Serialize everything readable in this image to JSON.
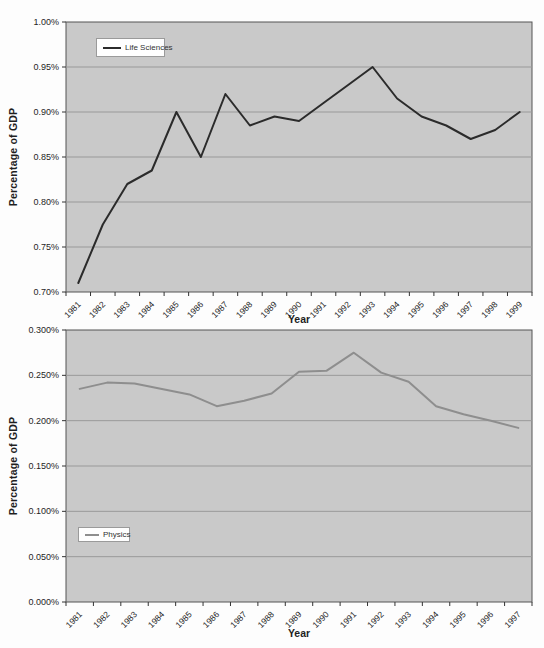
{
  "page": {
    "background": "#fdfdfd"
  },
  "chart_data": [
    {
      "type": "line",
      "title": "",
      "xlabel": "Year",
      "ylabel": "Percentage of GDP",
      "legend_position": "inside-top-left",
      "grid": true,
      "categories": [
        "1981",
        "1982",
        "1983",
        "1984",
        "1985",
        "1986",
        "1987",
        "1988",
        "1989",
        "1990",
        "1991",
        "1992",
        "1993",
        "1994",
        "1995",
        "1996",
        "1997",
        "1998",
        "1999"
      ],
      "series": [
        {
          "name": "Life Sciences",
          "color": "#2b2b2b",
          "values": [
            0.71,
            0.775,
            0.82,
            0.835,
            0.9,
            0.85,
            0.92,
            0.885,
            0.895,
            0.89,
            0.91,
            0.93,
            0.95,
            0.915,
            0.895,
            0.885,
            0.87,
            0.88,
            0.9
          ]
        }
      ],
      "ylim": [
        0.7,
        1.0
      ],
      "ytick_labels": [
        "1.00%",
        "0.95%",
        "0.90%",
        "0.85%",
        "0.80%",
        "0.75%",
        "0.70%"
      ],
      "plot_bg": "#c9c9c9",
      "grid_color": "#999999",
      "border_color": "#555555",
      "axis_text_color": "#1f1f1f"
    },
    {
      "type": "line",
      "title": "",
      "xlabel": "Year",
      "ylabel": "Percentage of GDP",
      "legend_position": "inside-bottom-left",
      "grid": true,
      "categories": [
        "1981",
        "1982",
        "1983",
        "1984",
        "1985",
        "1986",
        "1987",
        "1988",
        "1989",
        "1990",
        "1991",
        "1992",
        "1993",
        "1994",
        "1995",
        "1996",
        "1997"
      ],
      "series": [
        {
          "name": "Physics",
          "color": "#8e8e8e",
          "values": [
            0.235,
            0.242,
            0.241,
            0.235,
            0.229,
            0.216,
            0.222,
            0.23,
            0.254,
            0.255,
            0.275,
            0.253,
            0.243,
            0.216,
            0.207,
            0.2,
            0.192
          ]
        }
      ],
      "ylim": [
        0.0,
        0.3
      ],
      "ytick_labels": [
        "0.300%",
        "0.250%",
        "0.200%",
        "0.150%",
        "0.100%",
        "0.050%",
        "0.000%"
      ],
      "plot_bg": "#c9c9c9",
      "grid_color": "#999999",
      "border_color": "#555555",
      "axis_text_color": "#1f1f1f"
    }
  ]
}
